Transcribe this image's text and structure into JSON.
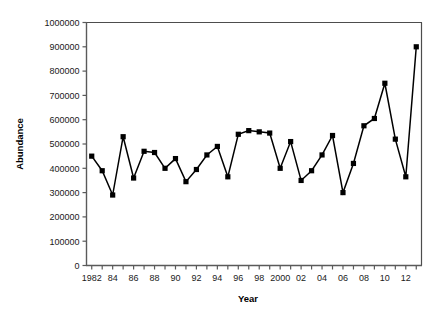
{
  "chart_data": {
    "type": "line",
    "title": "",
    "xlabel": "Year",
    "ylabel": "Abundance",
    "xlim": [
      1981.5,
      2013.5
    ],
    "ylim": [
      0,
      1000000
    ],
    "grid": false,
    "legend": "none",
    "marker": "square",
    "line_color": "#000000",
    "marker_color": "#000000",
    "x": [
      1982,
      1983,
      1984,
      1985,
      1986,
      1987,
      1988,
      1989,
      1990,
      1991,
      1992,
      1993,
      1994,
      1995,
      1996,
      1997,
      1998,
      1999,
      2000,
      2001,
      2002,
      2003,
      2004,
      2005,
      2006,
      2007,
      2008,
      2009,
      2010,
      2011,
      2012,
      2013
    ],
    "values": [
      450000,
      390000,
      290000,
      530000,
      360000,
      470000,
      465000,
      400000,
      440000,
      345000,
      395000,
      455000,
      490000,
      365000,
      540000,
      555000,
      550000,
      545000,
      400000,
      510000,
      350000,
      390000,
      455000,
      535000,
      300000,
      420000,
      575000,
      605000,
      750000,
      520000,
      365000,
      900000
    ],
    "x_tick_labels": [
      "1982",
      "84",
      "86",
      "88",
      "90",
      "92",
      "94",
      "96",
      "98",
      "2000",
      "02",
      "04",
      "06",
      "08",
      "10",
      "12"
    ],
    "x_tick_values": [
      1982,
      1984,
      1986,
      1988,
      1990,
      1992,
      1994,
      1996,
      1998,
      2000,
      2002,
      2004,
      2006,
      2008,
      2010,
      2012
    ],
    "y_tick_labels": [
      "0",
      "100000",
      "200000",
      "300000",
      "400000",
      "500000",
      "600000",
      "700000",
      "800000",
      "900000",
      "1000000"
    ],
    "y_tick_values": [
      0,
      100000,
      200000,
      300000,
      400000,
      500000,
      600000,
      700000,
      800000,
      900000,
      1000000
    ]
  }
}
